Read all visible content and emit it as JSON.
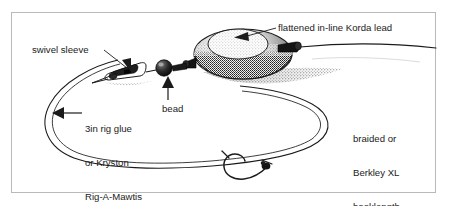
{
  "figure": {
    "type": "technical-illustration",
    "border_color": "#b9b9b9",
    "background_color": "#ffffff",
    "ink_color": "#1b1b1b",
    "labels": {
      "korda_lead": "flattened in-line Korda lead",
      "swivel_sleeve": "swivel sleeve",
      "rig_glue_line1": "3in rig glue",
      "rig_glue_line2": "or Kryston",
      "rig_glue_line3": "Rig-A-Mawtis",
      "bead": "bead",
      "hooklength_line1": "braided or",
      "hooklength_line2": "Berkley XL",
      "hooklength_line3": "hooklength"
    },
    "components": [
      {
        "name": "main-line",
        "description": "mono mainline entering from right edge"
      },
      {
        "name": "in-line-lead",
        "description": "flattened stippled oval lead with tail rubber"
      },
      {
        "name": "bead",
        "description": "small dark round bead on the line"
      },
      {
        "name": "swivel-sleeve",
        "description": "tapered rubber sleeve over the swivel"
      },
      {
        "name": "hooklength-loop",
        "description": "long braided hooklength loop"
      },
      {
        "name": "hook",
        "description": "curved-shank hook with knotless knot"
      }
    ],
    "arrows": [
      {
        "name": "arrow-korda-lead",
        "points_to": "in-line-lead"
      },
      {
        "name": "arrow-swivel-sleeve",
        "points_to": "swivel-sleeve"
      },
      {
        "name": "arrow-bead",
        "points_to": "bead"
      },
      {
        "name": "arrow-rig-glue",
        "points_to": "hooklength-loop"
      }
    ]
  }
}
